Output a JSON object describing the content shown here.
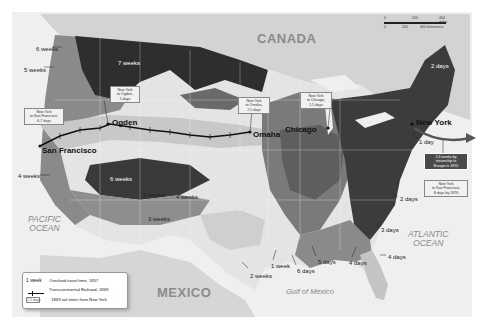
{
  "map": {
    "title": "Travel times across the United States, 1857 vs 1869",
    "regions": {
      "canada": "CANADA",
      "mexico": "MEXICO",
      "pacific_ocean": "PACIFIC\nOCEAN",
      "atlantic_ocean": "ATLANTIC\nOCEAN",
      "gulf": "Gulf of Mexico"
    },
    "cities": {
      "new_york": "New York",
      "chicago": "Chicago",
      "omaha": "Omaha",
      "ogden": "Ogden",
      "san_francisco": "San Francisco"
    },
    "travel_time_labels": [
      {
        "text": "6 weeks",
        "x": 36,
        "y": 46
      },
      {
        "text": "5 weeks",
        "x": 24,
        "y": 67
      },
      {
        "text": "7 weeks",
        "x": 118,
        "y": 60,
        "inverse": true
      },
      {
        "text": "4 weeks",
        "x": 18,
        "y": 173
      },
      {
        "text": "6 weeks",
        "x": 110,
        "y": 176,
        "inverse": true
      },
      {
        "text": "5 weeks",
        "x": 143,
        "y": 192
      },
      {
        "text": "4 weeks",
        "x": 176,
        "y": 194
      },
      {
        "text": "3 weeks",
        "x": 148,
        "y": 216
      },
      {
        "text": "2 weeks",
        "x": 250,
        "y": 273
      },
      {
        "text": "1 week",
        "x": 271,
        "y": 263
      },
      {
        "text": "6 days",
        "x": 297,
        "y": 268
      },
      {
        "text": "5 days",
        "x": 318,
        "y": 259
      },
      {
        "text": "4 days",
        "x": 349,
        "y": 260
      },
      {
        "text": "4 days",
        "x": 388,
        "y": 254
      },
      {
        "text": "3 days",
        "x": 381,
        "y": 227
      },
      {
        "text": "2 days",
        "x": 400,
        "y": 196
      },
      {
        "text": "2 days",
        "x": 431,
        "y": 63,
        "inverse": true
      },
      {
        "text": "1 day",
        "x": 419,
        "y": 139
      }
    ],
    "callouts": [
      {
        "text": "New York\nto San Francisco,\n6-7 days",
        "x": 24,
        "y": 108,
        "w": 34
      },
      {
        "text": "New York\nto Ogden,\n5 days",
        "x": 110,
        "y": 86,
        "w": 24
      },
      {
        "text": "New York\nto Omaha,\n2.5 days",
        "x": 238,
        "y": 97,
        "w": 26
      },
      {
        "text": "New York\nto Chicago,\n1.5 days",
        "x": 300,
        "y": 92,
        "w": 26
      },
      {
        "text": "2-3 weeks by\nsteamship to\nEurope in 1870",
        "x": 424,
        "y": 153,
        "w": 38,
        "dark": true
      },
      {
        "text": "New York\nto San Francisco,\n8 days by 1876",
        "x": 424,
        "y": 180,
        "w": 38
      }
    ],
    "scale_bar": {
      "miles": [
        "0",
        "200",
        "400 miles"
      ],
      "km": [
        "0",
        "200",
        "400 kilometers"
      ]
    }
  },
  "legend": {
    "items": [
      {
        "key": "1 week",
        "label": "Overland travel time, 1857"
      },
      {
        "key": "railroad-symbol",
        "label": "Transcontinental Railroad, 1869"
      },
      {
        "key": "2.5 days",
        "label": "1869 rail times from New York"
      }
    ]
  },
  "colors": {
    "darkest": "#2b2b2b",
    "dark": "#4f4f4f",
    "mid_dark": "#6e6e6e",
    "mid": "#8e8e8e",
    "light": "#b8b8b8",
    "lighter": "#d6d6d6",
    "lightest": "#e8e8e8",
    "water": "#f0f0f0",
    "canada_land": "#d0d0d0"
  }
}
